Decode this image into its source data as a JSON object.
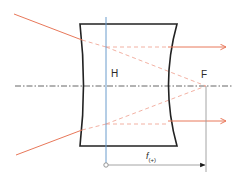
{
  "diagram": {
    "type": "optics-ray-diagram",
    "labels": {
      "principal_plane": "H",
      "focal_point": "F",
      "focal_length_symbol": "f",
      "focal_length_subscript": "(+)"
    },
    "colors": {
      "ray": "#e8785a",
      "virtual_ray": "#f0a898",
      "principal_plane": "#6a9ccc",
      "lens_outline": "#222222",
      "optical_axis": "#555555",
      "dimension_line": "#9a9a9a",
      "text": "#2a2a2a"
    },
    "elements": {
      "incoming_rays": 2,
      "outgoing_parallel_rays": 2,
      "virtual_rays_to_focus": 2
    }
  }
}
